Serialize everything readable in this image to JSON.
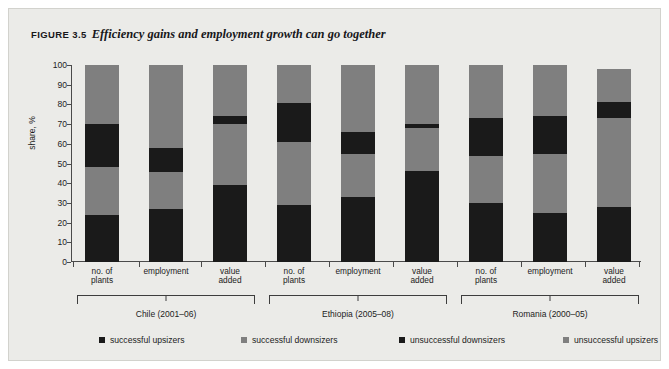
{
  "figure": {
    "number": "FIGURE 3.5",
    "caption": "Efficiency gains and employment growth can go together"
  },
  "chart_data": {
    "type": "bar",
    "stacked": true,
    "title": "Efficiency gains and employment growth can go together",
    "xlabel": "",
    "ylabel": "share, %",
    "ylim": [
      0,
      100
    ],
    "yticks": [
      0,
      10,
      20,
      30,
      40,
      50,
      60,
      70,
      80,
      90,
      100
    ],
    "grid": false,
    "legend_position": "bottom",
    "categories": [
      "no. of plants",
      "employment",
      "value added",
      "no. of plants",
      "employment",
      "value added",
      "no. of plants",
      "employment",
      "value added"
    ],
    "groups": [
      {
        "label": "Chile (2001–06)",
        "categories": [
          "no. of plants",
          "employment",
          "value added"
        ]
      },
      {
        "label": "Ethiopia (2005–08)",
        "categories": [
          "no. of plants",
          "employment",
          "value added"
        ]
      },
      {
        "label": "Romania (2000–05)",
        "categories": [
          "no. of plants",
          "employment",
          "value added"
        ]
      }
    ],
    "series": [
      {
        "name": "successful upsizers",
        "color": "#1a1a1a",
        "values": [
          24,
          27,
          39,
          29,
          33,
          46,
          30,
          25,
          28
        ]
      },
      {
        "name": "successful downsizers",
        "color": "#7f7f7f",
        "values": [
          24,
          18.5,
          31,
          32,
          22,
          22,
          24,
          30,
          45
        ]
      },
      {
        "name": "unsuccessful downsizers",
        "color": "#1a1a1a",
        "values": [
          22,
          12.5,
          4,
          19.5,
          11,
          2,
          19,
          19,
          8
        ]
      },
      {
        "name": "unsuccessful upsizers",
        "color": "#7f7f7f",
        "values": [
          30,
          42,
          26,
          19.5,
          34,
          30,
          27,
          26,
          17
        ]
      }
    ],
    "bar_totals": [
      100,
      100,
      100,
      100,
      100,
      100,
      100,
      100,
      98
    ],
    "bars": [
      {
        "group": "Chile (2001–06)",
        "category": "no. of plants",
        "boundaries": [
          0,
          24,
          48,
          70,
          100
        ]
      },
      {
        "group": "Chile (2001–06)",
        "category": "employment",
        "boundaries": [
          0,
          27,
          45.5,
          58,
          100
        ]
      },
      {
        "group": "Chile (2001–06)",
        "category": "value added",
        "boundaries": [
          0,
          39,
          70,
          74,
          100
        ]
      },
      {
        "group": "Ethiopia (2005–08)",
        "category": "no. of plants",
        "boundaries": [
          0,
          29,
          61,
          80.5,
          100
        ]
      },
      {
        "group": "Ethiopia (2005–08)",
        "category": "employment",
        "boundaries": [
          0,
          33,
          55,
          66,
          100
        ]
      },
      {
        "group": "Ethiopia (2005–08)",
        "category": "value added",
        "boundaries": [
          0,
          46,
          68,
          70,
          100
        ]
      },
      {
        "group": "Romania (2000–05)",
        "category": "no. of plants",
        "boundaries": [
          0,
          30,
          54,
          73,
          100
        ]
      },
      {
        "group": "Romania (2000–05)",
        "category": "employment",
        "boundaries": [
          0,
          25,
          55,
          74,
          100
        ]
      },
      {
        "group": "Romania (2000–05)",
        "category": "value added",
        "boundaries": [
          0,
          28,
          73,
          81,
          98
        ]
      }
    ],
    "legend": [
      {
        "label": "successful upsizers",
        "color": "#1a1a1a"
      },
      {
        "label": "successful downsizers",
        "color": "#7f7f7f"
      },
      {
        "label": "unsuccessful downsizers",
        "color": "#1a1a1a"
      },
      {
        "label": "unsuccessful upsizers",
        "color": "#7f7f7f"
      }
    ]
  }
}
